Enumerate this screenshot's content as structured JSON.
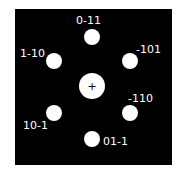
{
  "diagram": {
    "type": "electron-diffraction-pattern",
    "colors": {
      "background": "#000000",
      "spot": "#ffffff",
      "label": "#ffffff"
    },
    "center": {
      "x": 92,
      "y": 86,
      "r": 13,
      "mark": "+"
    },
    "spots": [
      {
        "id": "0-11",
        "label": "0-11",
        "x": 92,
        "y": 37,
        "r": 8,
        "lx": 76,
        "ly": 15
      },
      {
        "id": "-101",
        "label": "-101",
        "x": 130,
        "y": 61,
        "r": 8,
        "lx": 136,
        "ly": 44
      },
      {
        "id": "-110",
        "label": "-110",
        "x": 130,
        "y": 113,
        "r": 8,
        "lx": 128,
        "ly": 93
      },
      {
        "id": "01-1",
        "label": "01-1",
        "x": 92,
        "y": 139,
        "r": 8,
        "lx": 103,
        "ly": 136
      },
      {
        "id": "10-1",
        "label": "10-1",
        "x": 54,
        "y": 113,
        "r": 8,
        "lx": 23,
        "ly": 120
      },
      {
        "id": "1-10",
        "label": "1-10",
        "x": 54,
        "y": 61,
        "r": 8,
        "lx": 20,
        "ly": 48
      }
    ]
  }
}
